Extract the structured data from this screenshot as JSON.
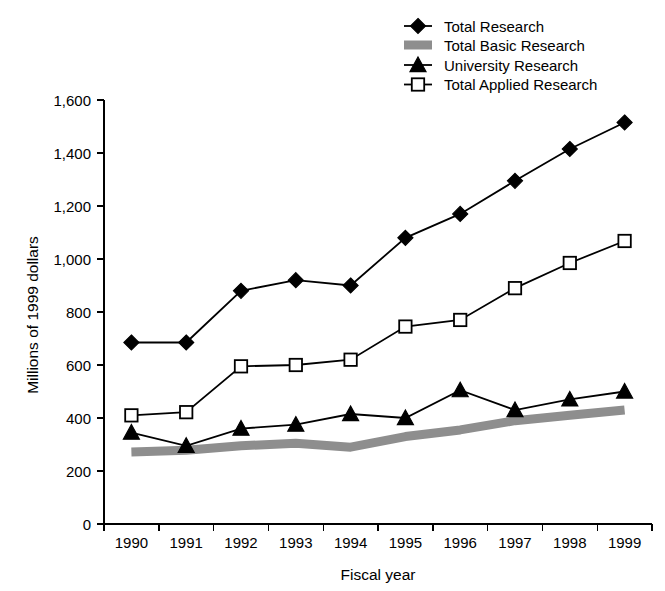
{
  "chart_data": {
    "type": "line",
    "title": "",
    "xlabel": "Fiscal year",
    "ylabel": "Millions of 1999 dollars",
    "categories": [
      "1990",
      "1991",
      "1992",
      "1993",
      "1994",
      "1995",
      "1996",
      "1997",
      "1998",
      "1999"
    ],
    "x": [
      1990,
      1991,
      1992,
      1993,
      1994,
      1995,
      1996,
      1997,
      1998,
      1999
    ],
    "ylim": [
      0,
      1600
    ],
    "yticks": [
      0,
      200,
      400,
      600,
      800,
      1000,
      1200,
      1400,
      1600
    ],
    "ytick_labels": [
      "0",
      "200",
      "400",
      "600",
      "800",
      "1,000",
      "1,200",
      "1,400",
      "1,600"
    ],
    "grid": false,
    "legend_position": "top-right",
    "series": [
      {
        "name": "Total Research",
        "marker": "filled-diamond",
        "values": [
          685,
          685,
          880,
          920,
          900,
          1080,
          1170,
          1295,
          1415,
          1515
        ]
      },
      {
        "name": "Total Basic Research",
        "marker": "gray-band",
        "values": [
          272,
          278,
          295,
          305,
          290,
          330,
          355,
          390,
          410,
          430
        ]
      },
      {
        "name": "University Research",
        "marker": "filled-triangle",
        "values": [
          345,
          295,
          360,
          375,
          415,
          400,
          505,
          430,
          470,
          500
        ]
      },
      {
        "name": "Total Applied Research",
        "marker": "open-square",
        "values": [
          410,
          422,
          595,
          600,
          620,
          745,
          770,
          890,
          985,
          1068
        ]
      }
    ]
  },
  "legend": {
    "items": [
      {
        "label": "Total Research",
        "icon": "filled-diamond-marker-icon"
      },
      {
        "label": "Total Basic Research",
        "icon": "gray-band-swatch-icon"
      },
      {
        "label": "University Research",
        "icon": "filled-triangle-marker-icon"
      },
      {
        "label": "Total Applied Research",
        "icon": "open-square-marker-icon"
      }
    ]
  },
  "colors": {
    "ink": "#000000",
    "band": "#8e8e8e",
    "background": "#ffffff"
  }
}
